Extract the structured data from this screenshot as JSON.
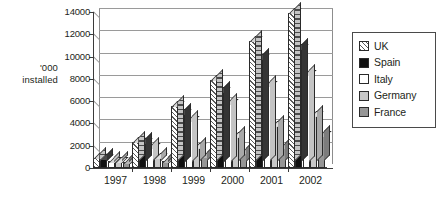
{
  "chart_data": {
    "type": "bar",
    "title": "",
    "subtitle": "",
    "xlabel": "",
    "ylabel": "'000 installed",
    "ylabel_lines": [
      "'000",
      "installed"
    ],
    "categories": [
      "1997",
      "1998",
      "1999",
      "2000",
      "2001",
      "2002"
    ],
    "ylim": [
      0,
      14000
    ],
    "ytick_labels": [
      "0",
      "2000",
      "4000",
      "6000",
      "8000",
      "10000",
      "12000",
      "14000"
    ],
    "ytick_values": [
      0,
      2000,
      4000,
      6000,
      8000,
      10000,
      12000,
      14000
    ],
    "grid": true,
    "grid_axis": "y",
    "legend_position": "right",
    "style": "3d-clustered-column",
    "series": [
      {
        "name": "UK",
        "key": "uk",
        "swatch": "diagonal-hatch",
        "color": "#ffffff",
        "values": [
          900,
          2350,
          5600,
          7900,
          11400,
          13950
        ]
      },
      {
        "name": "Spain",
        "key": "spain",
        "swatch": "solid",
        "color": "#111111",
        "values": [
          850,
          2250,
          4900,
          6900,
          9800,
          10700
        ]
      },
      {
        "name": "Italy",
        "key": "italy",
        "swatch": "solid",
        "color": "#ffffff",
        "values": [
          600,
          1800,
          4300,
          5800,
          7400,
          8400
        ]
      },
      {
        "name": "Germany",
        "key": "germany",
        "swatch": "solid",
        "color": "#c8c8c8",
        "values": [
          550,
          900,
          1800,
          2800,
          3800,
          4700
        ]
      },
      {
        "name": "France",
        "key": "france",
        "swatch": "solid",
        "color": "#969696",
        "values": [
          500,
          600,
          1000,
          1400,
          1800,
          2900
        ]
      }
    ]
  },
  "legend": {
    "items": [
      {
        "label": "UK"
      },
      {
        "label": "Spain"
      },
      {
        "label": "Italy"
      },
      {
        "label": "Germany"
      },
      {
        "label": "France"
      }
    ]
  },
  "caption": {
    "text": ""
  }
}
